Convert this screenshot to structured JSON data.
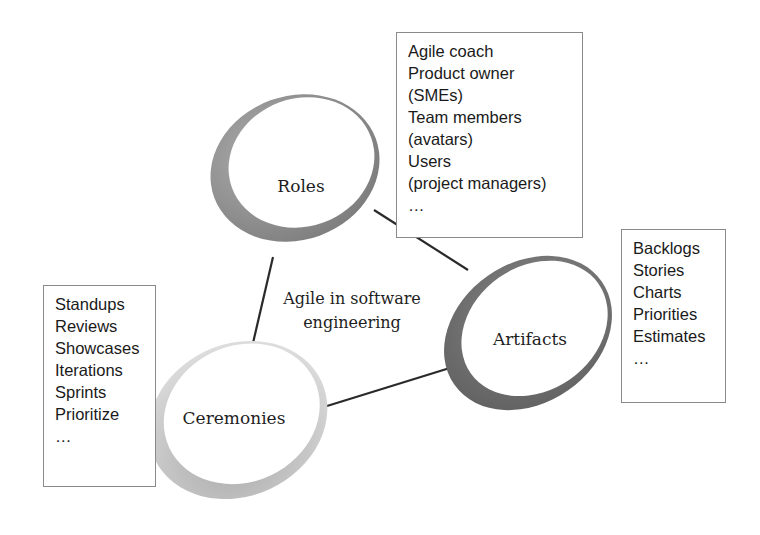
{
  "diagram": {
    "center_label": [
      "Agile in software",
      "engineering"
    ],
    "nodes": [
      {
        "id": "roles",
        "label": "Roles",
        "ring_color": "#8d8d8d"
      },
      {
        "id": "artifacts",
        "label": "Artifacts",
        "ring_color": "#6e6e6e"
      },
      {
        "id": "ceremonies",
        "label": "Ceremonies",
        "ring_color": "#b5b5b5"
      }
    ],
    "lists": {
      "roles": [
        "Agile coach",
        "Product owner",
        "(SMEs)",
        "Team members",
        "(avatars)",
        "Users",
        "(project managers)",
        "…"
      ],
      "artifacts": [
        "Backlogs",
        "Stories",
        "Charts",
        "Priorities",
        "Estimates",
        "…"
      ],
      "ceremonies": [
        "Standups",
        "Reviews",
        "Showcases",
        "Iterations",
        "Sprints",
        "Prioritize",
        "…"
      ]
    },
    "connections": [
      [
        "roles",
        "artifacts"
      ],
      [
        "roles",
        "ceremonies"
      ],
      [
        "ceremonies",
        "artifacts"
      ]
    ]
  }
}
